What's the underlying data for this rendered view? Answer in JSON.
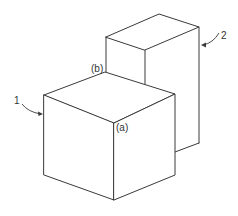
{
  "diagram": {
    "type": "isometric-blocks",
    "labels": {
      "block_front": "1",
      "block_back": "2",
      "vertex_a": "(a)",
      "vertex_b": "(b)"
    },
    "colors": {
      "stroke": "#3a3a3a",
      "background": "#ffffff"
    },
    "blocks": [
      {
        "id": "1",
        "description": "front cube"
      },
      {
        "id": "2",
        "description": "back tall box"
      }
    ]
  }
}
